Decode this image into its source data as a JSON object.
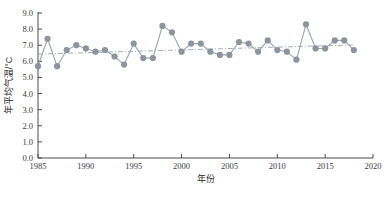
{
  "chart_data": {
    "type": "line",
    "title": "",
    "xlabel": "年份",
    "ylabel": "年平均气温/°C",
    "xlim": [
      1985,
      2020
    ],
    "ylim": [
      0.0,
      9.0
    ],
    "xticks": [
      1985,
      1990,
      1995,
      2000,
      2005,
      2010,
      2015,
      2020
    ],
    "yticks": [
      "0.0",
      "1.0",
      "2.0",
      "3.0",
      "4.0",
      "5.0",
      "6.0",
      "7.0",
      "8.0",
      "9.0"
    ],
    "grid": false,
    "legend": "none",
    "marker": "filled-circle",
    "marker_color": "#8c949e",
    "line_color": "#9aa3ad",
    "trend_color": "#9aa3ad",
    "trend_style": "dash-dot",
    "x": [
      1985,
      1986,
      1987,
      1988,
      1989,
      1990,
      1991,
      1992,
      1993,
      1994,
      1995,
      1996,
      1997,
      1998,
      1999,
      2000,
      2001,
      2002,
      2003,
      2004,
      2005,
      2006,
      2007,
      2008,
      2009,
      2010,
      2011,
      2012,
      2013,
      2014,
      2015,
      2016,
      2017,
      2018
    ],
    "values": [
      5.7,
      7.4,
      5.7,
      6.7,
      7.0,
      6.8,
      6.6,
      6.7,
      6.3,
      5.8,
      7.1,
      6.2,
      6.2,
      8.2,
      7.8,
      6.6,
      7.1,
      7.1,
      6.6,
      6.4,
      6.4,
      7.2,
      7.1,
      6.6,
      7.3,
      6.7,
      6.6,
      6.1,
      8.3,
      6.8,
      6.8,
      7.3,
      7.3,
      6.7
    ],
    "trend": {
      "start_year": 1985,
      "start_value": 6.45,
      "end_year": 2018,
      "end_value": 7.02
    }
  }
}
